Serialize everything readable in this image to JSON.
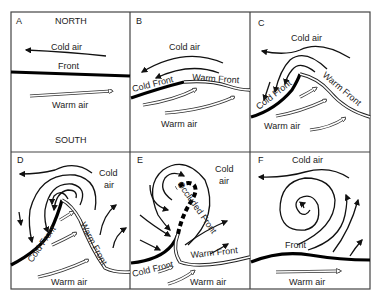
{
  "figure": {
    "orientation": {
      "north": "NORTH",
      "south": "SOUTH"
    },
    "panels": [
      {
        "id": "A",
        "labels": {
          "cold_air": "Cold air",
          "front": "Front",
          "warm_air": "Warm air"
        }
      },
      {
        "id": "B",
        "labels": {
          "cold_air": "Cold air",
          "cold_front": "Cold Front",
          "warm_front": "Warm Front",
          "warm_air": "Warm air"
        }
      },
      {
        "id": "C",
        "labels": {
          "cold_air": "Cold air",
          "cold_front": "Cold Front",
          "warm_front": "Warm Front",
          "warm_air": "Warm air"
        }
      },
      {
        "id": "D",
        "labels": {
          "cold_air_1": "Cold",
          "cold_air_2": "air",
          "cold_front": "Cold Front",
          "warm_front": "Warm Front",
          "warm_air": "Warm air"
        }
      },
      {
        "id": "E",
        "labels": {
          "cold_air_1": "Cold",
          "cold_air_2": "air",
          "occluded_front": "Occluded Front",
          "cold_front": "Cold Front",
          "warm_front": "Warm Front",
          "warm_air": "Warm air"
        }
      },
      {
        "id": "F",
        "labels": {
          "cold_air": "Cold air",
          "front": "Front",
          "warm_air": "Warm air"
        }
      }
    ]
  },
  "colors": {
    "line": "#111111",
    "border": "#444444",
    "background": "#ffffff"
  }
}
